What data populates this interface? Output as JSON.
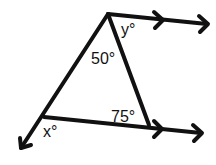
{
  "diagram": {
    "type": "geometry-parallel-lines-triangle",
    "labels": {
      "apex_angle": "50°",
      "bottom_right_angle": "75°",
      "exterior_top": "y°",
      "exterior_bottom_left": "x°"
    },
    "colors": {
      "stroke": "#111111",
      "background": "#ffffff"
    }
  }
}
